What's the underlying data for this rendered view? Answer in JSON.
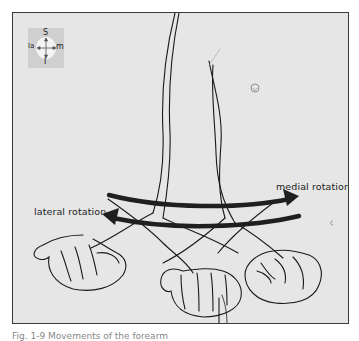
{
  "figure": {
    "orientation_compass": {
      "top": "S",
      "left": "la",
      "right": "m",
      "bottom": "I"
    },
    "labels": {
      "lateral": "lateral rotation",
      "medial": "medial rotation"
    },
    "arrows": [
      {
        "name": "medial-rotation-arrow",
        "direction": "right"
      },
      {
        "name": "lateral-rotation-arrow",
        "direction": "left"
      }
    ],
    "colors": {
      "frame_fill": "#e6e6e6",
      "line": "#1a1a1a",
      "arrow": "#1f1f1f"
    },
    "caption": "Fig. 1-9  Movements of the forearm"
  }
}
